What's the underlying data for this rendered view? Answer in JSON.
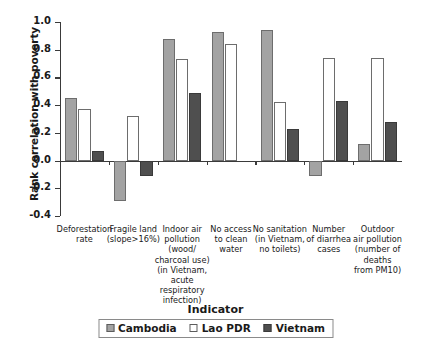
{
  "chart_data": {
    "type": "bar",
    "title": "",
    "xlabel": "Indicator",
    "ylabel": "Rank correlation with poverty",
    "ylim": [
      -0.4,
      1.0
    ],
    "yticks": [
      "1.0",
      "0.8",
      "0.6",
      "0.4",
      "0.2",
      "0.0",
      "-0.2",
      "-0.4"
    ],
    "ytick_values": [
      1.0,
      0.8,
      0.6,
      0.4,
      0.2,
      0.0,
      -0.2,
      -0.4
    ],
    "grid": false,
    "legend_position": "bottom",
    "categories": [
      "Deforestation rate",
      "Fragile land (slope>16%)",
      "Indoor air pollution (wood/charcoal use) (in Vietnam, acute respiratory infection)",
      "No access to clean water",
      "No sanitation (in Vietnam, no toilets)",
      "Number of diarrhea cases",
      "Outdoor air pollution (number of deaths from PM10)"
    ],
    "category_lines": [
      [
        "Deforestation",
        "rate"
      ],
      [
        "Fragile land",
        "(slope>16%)"
      ],
      [
        "Indoor air",
        "pollution",
        "(wood/",
        "charcoal use)",
        "(in Vietnam,",
        "acute",
        "respiratory",
        "infection)"
      ],
      [
        "No access",
        "to clean",
        "water"
      ],
      [
        "No sanitation",
        "(in Vietnam,",
        "no toilets)"
      ],
      [
        "Number",
        "of diarrhea",
        "cases"
      ],
      [
        "Outdoor",
        "air pollution",
        "(number of",
        "deaths",
        "from PM10)"
      ]
    ],
    "series": [
      {
        "name": "Cambodia",
        "color": "#a3a3a3",
        "values": [
          0.45,
          -0.29,
          0.88,
          0.93,
          0.94,
          -0.11,
          0.12
        ]
      },
      {
        "name": "Lao PDR",
        "color": "#ffffff",
        "values": [
          0.37,
          0.32,
          0.73,
          0.84,
          0.42,
          0.74,
          0.74
        ]
      },
      {
        "name": "Vietnam",
        "color": "#4f4f4f",
        "values": [
          0.07,
          -0.11,
          0.49,
          0.0,
          0.23,
          0.43,
          0.28
        ]
      }
    ]
  },
  "legend": {
    "items": [
      {
        "label": "Cambodia"
      },
      {
        "label": "Lao PDR"
      },
      {
        "label": "Vietnam"
      }
    ]
  }
}
